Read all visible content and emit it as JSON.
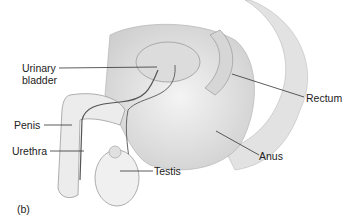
{
  "figure": {
    "panel_label": "(b)",
    "labels": {
      "urinary_bladder": [
        "Urinary",
        "bladder"
      ],
      "rectum": "Rectum",
      "penis": "Penis",
      "urethra": "Urethra",
      "testis": "Testis",
      "anus": "Anus"
    }
  }
}
